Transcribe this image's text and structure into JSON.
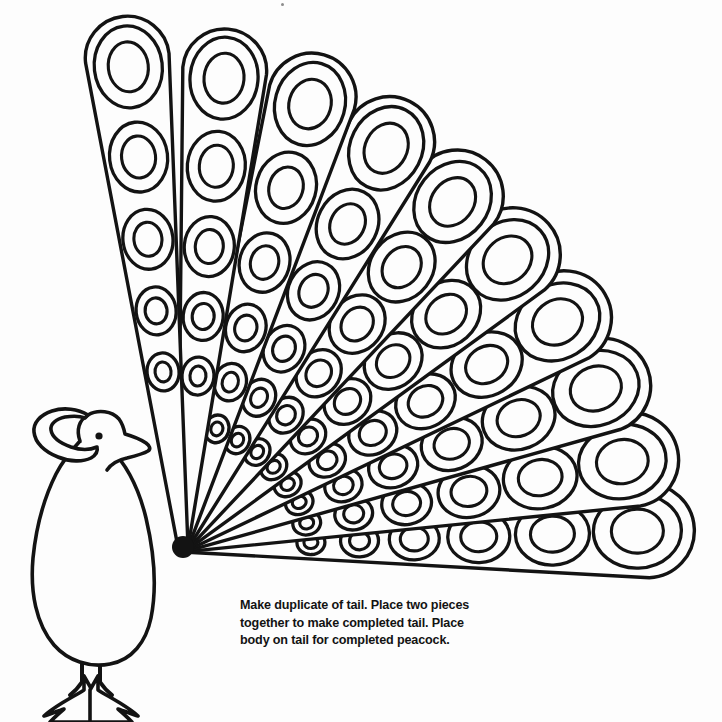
{
  "page": {
    "background_color": "#fdfdfd",
    "ink_color": "#131313",
    "width": 722,
    "height": 722
  },
  "caption": {
    "text": "Make duplicate of tail. Place two pieces\ntogether  to make completed tail. Place\nbody on tail for completed peacock.",
    "line_1": "Make duplicate of tail. Place two pieces",
    "line_2": "together  to make completed tail. Place",
    "line_3": "body on tail for completed peacock.",
    "x": 240,
    "y": 597,
    "font_size": 12.6
  },
  "tail": {
    "label": "peacock-tail-fan",
    "hub": {
      "x": 183,
      "y": 547
    },
    "feather_count": 10,
    "angle_start_deg": -96,
    "angle_end_deg": -2,
    "feathers": [
      {
        "index": 0,
        "angle_deg": -96.5,
        "length": 534,
        "half_width_tip": 42,
        "half_width_base": 5,
        "eyes": [
          {
            "t": 0.905,
            "rx": 34,
            "ry": 41,
            "irx": 20,
            "iry": 25
          },
          {
            "t": 0.735,
            "rx": 29,
            "ry": 35,
            "irx": 17,
            "iry": 21
          },
          {
            "t": 0.58,
            "rx": 25,
            "ry": 30,
            "irx": 14,
            "iry": 17
          },
          {
            "t": 0.445,
            "rx": 20,
            "ry": 24,
            "irx": 11,
            "iry": 13
          },
          {
            "t": 0.33,
            "rx": 16,
            "ry": 19,
            "irx": 8,
            "iry": 10
          }
        ]
      },
      {
        "index": 1,
        "angle_deg": -85.0,
        "length": 520,
        "half_width_tip": 42,
        "half_width_base": 5,
        "eyes": [
          {
            "t": 0.905,
            "rx": 34,
            "ry": 41,
            "irx": 20,
            "iry": 25
          },
          {
            "t": 0.735,
            "rx": 29,
            "ry": 35,
            "irx": 17,
            "iry": 21
          },
          {
            "t": 0.58,
            "rx": 25,
            "ry": 30,
            "irx": 14,
            "iry": 17
          },
          {
            "t": 0.445,
            "rx": 20,
            "ry": 24,
            "irx": 11,
            "iry": 13
          },
          {
            "t": 0.33,
            "rx": 16,
            "ry": 19,
            "irx": 8,
            "iry": 10
          }
        ]
      },
      {
        "index": 2,
        "angle_deg": -74.0,
        "length": 512,
        "half_width_tip": 44,
        "half_width_base": 5,
        "eyes": [
          {
            "t": 0.9,
            "rx": 35,
            "ry": 42,
            "irx": 21,
            "iry": 25
          },
          {
            "t": 0.73,
            "rx": 30,
            "ry": 36,
            "irx": 17,
            "iry": 21
          },
          {
            "t": 0.578,
            "rx": 25,
            "ry": 30,
            "irx": 14,
            "iry": 17
          },
          {
            "t": 0.445,
            "rx": 20,
            "ry": 24,
            "irx": 11,
            "iry": 13
          },
          {
            "t": 0.335,
            "rx": 16,
            "ry": 19,
            "irx": 8,
            "iry": 10
          },
          {
            "t": 0.24,
            "rx": 12,
            "ry": 14,
            "irx": 6,
            "iry": 7
          }
        ]
      },
      {
        "index": 3,
        "angle_deg": -63.0,
        "length": 500,
        "half_width_tip": 45,
        "half_width_base": 5,
        "eyes": [
          {
            "t": 0.895,
            "rx": 36,
            "ry": 43,
            "irx": 21,
            "iry": 26
          },
          {
            "t": 0.725,
            "rx": 30,
            "ry": 36,
            "irx": 17,
            "iry": 21
          },
          {
            "t": 0.575,
            "rx": 25,
            "ry": 30,
            "irx": 14,
            "iry": 17
          },
          {
            "t": 0.445,
            "rx": 20,
            "ry": 24,
            "irx": 11,
            "iry": 13
          },
          {
            "t": 0.335,
            "rx": 16,
            "ry": 19,
            "irx": 8,
            "iry": 10
          },
          {
            "t": 0.24,
            "rx": 12,
            "ry": 14,
            "irx": 6,
            "iry": 7
          }
        ]
      },
      {
        "index": 4,
        "angle_deg": -52.0,
        "length": 492,
        "half_width_tip": 46,
        "half_width_base": 5,
        "eyes": [
          {
            "t": 0.89,
            "rx": 36,
            "ry": 43,
            "irx": 21,
            "iry": 26
          },
          {
            "t": 0.722,
            "rx": 31,
            "ry": 37,
            "irx": 18,
            "iry": 22
          },
          {
            "t": 0.575,
            "rx": 26,
            "ry": 31,
            "irx": 15,
            "iry": 18
          },
          {
            "t": 0.448,
            "rx": 21,
            "ry": 25,
            "irx": 12,
            "iry": 14
          },
          {
            "t": 0.34,
            "rx": 16,
            "ry": 19,
            "irx": 9,
            "iry": 10
          },
          {
            "t": 0.245,
            "rx": 12,
            "ry": 14,
            "irx": 6,
            "iry": 7
          }
        ]
      },
      {
        "index": 5,
        "angle_deg": -41.5,
        "length": 488,
        "half_width_tip": 47,
        "half_width_base": 5,
        "eyes": [
          {
            "t": 0.888,
            "rx": 37,
            "ry": 44,
            "irx": 22,
            "iry": 26
          },
          {
            "t": 0.72,
            "rx": 31,
            "ry": 37,
            "irx": 18,
            "iry": 22
          },
          {
            "t": 0.575,
            "rx": 26,
            "ry": 31,
            "irx": 15,
            "iry": 18
          },
          {
            "t": 0.45,
            "rx": 21,
            "ry": 25,
            "irx": 12,
            "iry": 14
          },
          {
            "t": 0.342,
            "rx": 16,
            "ry": 19,
            "irx": 9,
            "iry": 10
          },
          {
            "t": 0.248,
            "rx": 12,
            "ry": 14,
            "irx": 6,
            "iry": 7
          }
        ]
      },
      {
        "index": 6,
        "angle_deg": -31.0,
        "length": 492,
        "half_width_tip": 47,
        "half_width_base": 5,
        "eyes": [
          {
            "t": 0.888,
            "rx": 37,
            "ry": 44,
            "irx": 22,
            "iry": 26
          },
          {
            "t": 0.72,
            "rx": 31,
            "ry": 37,
            "irx": 18,
            "iry": 22
          },
          {
            "t": 0.575,
            "rx": 26,
            "ry": 31,
            "irx": 15,
            "iry": 18
          },
          {
            "t": 0.45,
            "rx": 21,
            "ry": 25,
            "irx": 12,
            "iry": 14
          },
          {
            "t": 0.342,
            "rx": 16,
            "ry": 19,
            "irx": 9,
            "iry": 10
          },
          {
            "t": 0.248,
            "rx": 12,
            "ry": 14,
            "irx": 6,
            "iry": 7
          }
        ]
      },
      {
        "index": 7,
        "angle_deg": -21.0,
        "length": 498,
        "half_width_tip": 47,
        "half_width_base": 5,
        "eyes": [
          {
            "t": 0.888,
            "rx": 37,
            "ry": 44,
            "irx": 22,
            "iry": 26
          },
          {
            "t": 0.722,
            "rx": 31,
            "ry": 37,
            "irx": 18,
            "iry": 22
          },
          {
            "t": 0.578,
            "rx": 26,
            "ry": 31,
            "irx": 15,
            "iry": 18
          },
          {
            "t": 0.452,
            "rx": 21,
            "ry": 25,
            "irx": 12,
            "iry": 14
          },
          {
            "t": 0.345,
            "rx": 16,
            "ry": 19,
            "irx": 9,
            "iry": 10
          },
          {
            "t": 0.25,
            "rx": 12,
            "ry": 14,
            "irx": 6,
            "iry": 7
          }
        ]
      },
      {
        "index": 8,
        "angle_deg": -11.0,
        "length": 504,
        "half_width_tip": 47,
        "half_width_base": 5,
        "eyes": [
          {
            "t": 0.888,
            "rx": 37,
            "ry": 44,
            "irx": 22,
            "iry": 26
          },
          {
            "t": 0.722,
            "rx": 31,
            "ry": 37,
            "irx": 18,
            "iry": 22
          },
          {
            "t": 0.578,
            "rx": 26,
            "ry": 31,
            "irx": 15,
            "iry": 18
          },
          {
            "t": 0.452,
            "rx": 21,
            "ry": 25,
            "irx": 12,
            "iry": 14
          },
          {
            "t": 0.345,
            "rx": 16,
            "ry": 19,
            "irx": 9,
            "iry": 10
          },
          {
            "t": 0.25,
            "rx": 12,
            "ry": 14,
            "irx": 6,
            "iry": 7
          }
        ]
      },
      {
        "index": 9,
        "angle_deg": -2.0,
        "length": 512,
        "half_width_tip": 47,
        "half_width_base": 5,
        "eyes": [
          {
            "t": 0.888,
            "rx": 37,
            "ry": 44,
            "irx": 22,
            "iry": 26
          },
          {
            "t": 0.722,
            "rx": 31,
            "ry": 37,
            "irx": 18,
            "iry": 22
          },
          {
            "t": 0.578,
            "rx": 26,
            "ry": 31,
            "irx": 15,
            "iry": 18
          },
          {
            "t": 0.452,
            "rx": 21,
            "ry": 25,
            "irx": 12,
            "iry": 14
          },
          {
            "t": 0.345,
            "rx": 16,
            "ry": 19,
            "irx": 9,
            "iry": 10
          },
          {
            "t": 0.25,
            "rx": 12,
            "ry": 14,
            "irx": 6,
            "iry": 7
          }
        ]
      }
    ]
  },
  "bird": {
    "label": "peacock-body",
    "body_path": "M 62 470 C 46 503 36 545 34 580 C 32 618 44 648 68 661 C 86 670 106 670 122 661 C 144 649 152 622 150 592 C 148 552 136 510 118 478",
    "neck_left_path": "M 62 470 C 72 458 78 450 80 441",
    "neck_right_path": "M 118 478 C 114 462 110 450 108 441",
    "head_path": "M 80 441 C 78 432 80 424 87 420 C 96 414 108 415 114 421 C 118 425 121 430 122 436 C 126 437 131 439 136 442 C 140 444 142 446 141 448 C 139 450 134 452 128 454 C 120 456 113 458 110 462 C 108 465 108 468 108 441",
    "head_outline_path": "M 122 436 C 127 437 133 440 138 443 C 141 445 142 447 140 449 C 137 451 131 453 125 455 C 118 457 112 459 109 463",
    "crest_path": "M 87 420 C 78 415 66 414 56 418 C 48 421 44 427 45 433 C 46 440 52 446 60 450 C 70 455 80 456 88 454 C 94 452 97 449 96 445",
    "crest_inner_path": "M 56 418 C 50 422 48 428 50 433 C 53 440 62 446 72 448",
    "eye": {
      "cx": 99,
      "cy": 436,
      "r": 3.6
    },
    "leg_left_path": "M 82 659 L 82 682 M 82 682 C 78 688 74 692 70 695",
    "leg_right_path": "M 100 659 L 100 682 M 100 682 C 104 688 108 692 112 695",
    "feet_path": "M 72 690 C 62 694 52 700 44 708 M 72 690 C 66 698 62 706 60 714 M 72 690 C 74 698 76 706 78 712 M 110 690 C 120 694 130 700 138 708 M 110 690 C 116 698 120 706 122 714 M 110 690 C 108 698 106 706 104 712",
    "foot_left_path": "M 84 676 L 84 690 C 78 694 70 698 62 703 C 54 708 48 712 44 716 C 50 714 58 711 64 709 C 58 714 53 719 50 722 L 92 722 L 92 690 Z",
    "foot_right_path": "M 98 676 L 98 690 C 104 694 112 698 120 703 C 128 708 134 712 138 716 C 132 714 124 711 118 709 C 124 714 129 719 132 722 L 90 722 L 90 690 Z"
  },
  "marks": {
    "speck": {
      "x": 281,
      "y": 3,
      "size": 3
    }
  }
}
